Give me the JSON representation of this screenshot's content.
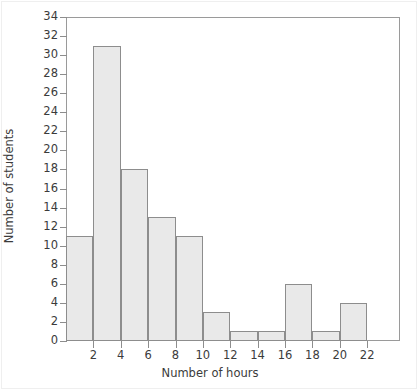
{
  "chart_data": {
    "type": "bar",
    "title": "",
    "xlabel": "Number of hours",
    "ylabel": "Number of students",
    "xlim": [
      0,
      24.4
    ],
    "ylim": [
      0,
      34
    ],
    "grid": false,
    "legend": null,
    "bin_width": 2,
    "bin_edges": [
      0,
      2,
      4,
      6,
      8,
      10,
      12,
      14,
      16,
      18,
      20,
      22
    ],
    "categories": [
      "0-2",
      "2-4",
      "4-6",
      "6-8",
      "8-10",
      "10-12",
      "12-14",
      "14-16",
      "16-18",
      "18-20",
      "20-22"
    ],
    "values": [
      11,
      31,
      18,
      13,
      11,
      3,
      1,
      1,
      6,
      1,
      4
    ],
    "x_ticks": [
      2,
      4,
      6,
      8,
      10,
      12,
      14,
      16,
      18,
      20,
      22
    ],
    "x_tick_labels": [
      "2",
      "4",
      "6",
      "8",
      "10",
      "12",
      "14",
      "16",
      "18",
      "20",
      "22"
    ],
    "y_ticks": [
      0,
      2,
      4,
      6,
      8,
      10,
      12,
      14,
      16,
      18,
      20,
      22,
      24,
      26,
      28,
      30,
      32,
      34
    ],
    "y_tick_labels": [
      "0",
      "2",
      "4",
      "6",
      "8",
      "10",
      "12",
      "14",
      "16",
      "18",
      "20",
      "22",
      "24",
      "26",
      "28",
      "30",
      "32",
      "34"
    ],
    "colors": {
      "bar_fill": "#e9e9e9",
      "bar_border": "#8d8d8d",
      "axis": "#9a9a9a",
      "text": "#3b3b3b",
      "background": "#ffffff"
    }
  }
}
